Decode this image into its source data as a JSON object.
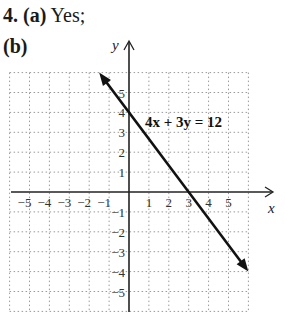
{
  "problem": {
    "number": "4.",
    "part_a_label": "(a)",
    "part_a_answer": "Yes;",
    "part_b_label": "(b)"
  },
  "chart_data": {
    "type": "line",
    "title": "",
    "equation_label": "4x + 3y = 12",
    "xlabel": "x",
    "ylabel": "y",
    "xlim": [
      -6,
      6
    ],
    "ylim": [
      -6,
      6
    ],
    "grid": true,
    "grid_style": "dotted",
    "x_tick_labels": [
      "-5",
      "-4",
      "-3",
      "-2",
      "-1",
      "1",
      "2",
      "3",
      "4",
      "5"
    ],
    "y_tick_labels": [
      "5",
      "4",
      "3",
      "2",
      "1",
      "-1",
      "-2",
      "-3",
      "-4",
      "-5"
    ],
    "series": [
      {
        "name": "4x + 3y = 12",
        "points": [
          [
            -1.5,
            6
          ],
          [
            0,
            4
          ],
          [
            3,
            0
          ],
          [
            6,
            -4
          ]
        ],
        "x_intercept": 3,
        "y_intercept": 4,
        "arrows": "both"
      }
    ]
  }
}
